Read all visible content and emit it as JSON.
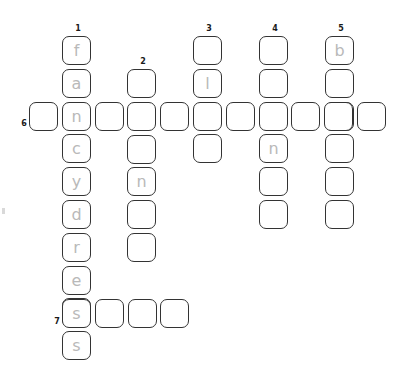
{
  "puzzle": {
    "title": "crossword-grid",
    "cell_size": 29,
    "pitch": 32.8,
    "colors": {
      "cell_border": "#333333",
      "cell_background": "#ffffff",
      "letter": "#b9b9b9",
      "clue_number": "#1a1a1a",
      "page_background": "#ffffff"
    },
    "clue_numbers": [
      {
        "label": "1",
        "x": 72,
        "y": 24
      },
      {
        "label": "2",
        "x": 137,
        "y": 57
      },
      {
        "label": "3",
        "x": 203,
        "y": 24
      },
      {
        "label": "4",
        "x": 269,
        "y": 24
      },
      {
        "label": "5",
        "x": 335,
        "y": 24
      },
      {
        "label": "6",
        "x": 18,
        "y": 119
      },
      {
        "label": "7",
        "x": 51,
        "y": 317
      }
    ],
    "entries": [
      {
        "number": "1",
        "direction": "down",
        "x": 62,
        "y": 36,
        "letters": [
          "f",
          "a",
          "n",
          "c",
          "y",
          "d",
          "r",
          "e",
          "s",
          "s"
        ]
      },
      {
        "number": "2",
        "direction": "down",
        "x": 127,
        "y": 69,
        "letters": [
          "",
          "",
          "",
          "n",
          "",
          ""
        ]
      },
      {
        "number": "3",
        "direction": "down",
        "x": 193,
        "y": 36,
        "letters": [
          "",
          "l",
          "",
          ""
        ]
      },
      {
        "number": "4",
        "direction": "down",
        "x": 259,
        "y": 36,
        "letters": [
          "",
          "",
          "",
          "n",
          "",
          ""
        ]
      },
      {
        "number": "5",
        "direction": "down",
        "x": 325,
        "y": 36,
        "letters": [
          "b",
          "",
          "",
          "",
          "",
          ""
        ]
      },
      {
        "number": "6",
        "direction": "across",
        "x": 29,
        "y": 102,
        "letters": [
          "",
          "n",
          "",
          "",
          "",
          "",
          "",
          "",
          "",
          "",
          ""
        ]
      },
      {
        "number": "7",
        "direction": "across",
        "x": 62,
        "y": 299,
        "letters": [
          "s",
          "",
          "",
          ""
        ]
      }
    ]
  }
}
